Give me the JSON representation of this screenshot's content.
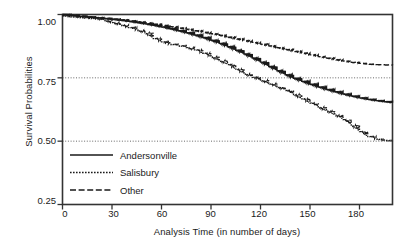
{
  "chart_data": {
    "type": "line",
    "title": "",
    "xlabel": "Analysis Time (in number of days)",
    "ylabel": "Survival Probabilities",
    "xlim": [
      0,
      200
    ],
    "ylim": [
      0.25,
      1.0
    ],
    "xticks": [
      0,
      30,
      60,
      90,
      120,
      150,
      180
    ],
    "yticks": [
      0.25,
      0.5,
      0.75,
      1.0
    ],
    "ytick_labels": [
      "0.25",
      "0.50",
      "0.75",
      "1.00"
    ],
    "xtick_labels": [
      "0",
      "30",
      "60",
      "90",
      "120",
      "150",
      "180"
    ],
    "grid": "horizontal-dotted-at-yticks",
    "legend_position": "lower-left-inside",
    "step_style": "kaplan-meier-step",
    "series": [
      {
        "name": "Andersonville",
        "style": "solid",
        "color": "#1a1a1a",
        "x": [
          0,
          5,
          10,
          15,
          20,
          25,
          30,
          35,
          40,
          45,
          50,
          55,
          60,
          65,
          70,
          75,
          80,
          85,
          90,
          95,
          100,
          105,
          110,
          115,
          120,
          125,
          130,
          135,
          140,
          145,
          150,
          155,
          160,
          165,
          170,
          175,
          180,
          185,
          190,
          195,
          200
        ],
        "y": [
          1.0,
          0.996,
          0.993,
          0.99,
          0.987,
          0.984,
          0.981,
          0.977,
          0.973,
          0.968,
          0.963,
          0.957,
          0.951,
          0.944,
          0.936,
          0.928,
          0.919,
          0.909,
          0.898,
          0.886,
          0.873,
          0.859,
          0.844,
          0.828,
          0.812,
          0.795,
          0.778,
          0.762,
          0.748,
          0.736,
          0.725,
          0.714,
          0.704,
          0.695,
          0.686,
          0.678,
          0.671,
          0.665,
          0.66,
          0.656,
          0.652
        ]
      },
      {
        "name": "Salisbury",
        "style": "dotted",
        "color": "#1a1a1a",
        "x": [
          0,
          5,
          10,
          15,
          20,
          25,
          30,
          35,
          40,
          45,
          50,
          55,
          60,
          65,
          70,
          75,
          80,
          85,
          90,
          95,
          100,
          105,
          110,
          115,
          120,
          125,
          130,
          135,
          140,
          145,
          150,
          155,
          160,
          165,
          170,
          175,
          180,
          185,
          190,
          195,
          200
        ],
        "y": [
          0.995,
          0.991,
          0.988,
          0.985,
          0.982,
          0.977,
          0.968,
          0.958,
          0.948,
          0.938,
          0.928,
          0.905,
          0.892,
          0.882,
          0.876,
          0.869,
          0.86,
          0.847,
          0.833,
          0.818,
          0.802,
          0.784,
          0.766,
          0.752,
          0.74,
          0.727,
          0.714,
          0.7,
          0.684,
          0.667,
          0.65,
          0.634,
          0.618,
          0.603,
          0.585,
          0.563,
          0.538,
          0.518,
          0.508,
          0.503,
          0.5
        ]
      },
      {
        "name": "Other",
        "style": "dashed",
        "color": "#1a1a1a",
        "x": [
          0,
          5,
          10,
          15,
          20,
          25,
          30,
          35,
          40,
          45,
          50,
          55,
          60,
          65,
          70,
          75,
          80,
          85,
          90,
          95,
          100,
          105,
          110,
          115,
          120,
          125,
          130,
          135,
          140,
          145,
          150,
          155,
          160,
          165,
          170,
          175,
          180,
          185,
          190,
          195,
          200
        ],
        "y": [
          1.0,
          0.997,
          0.994,
          0.991,
          0.988,
          0.985,
          0.982,
          0.979,
          0.975,
          0.971,
          0.967,
          0.962,
          0.957,
          0.952,
          0.947,
          0.942,
          0.936,
          0.93,
          0.924,
          0.918,
          0.911,
          0.904,
          0.897,
          0.89,
          0.883,
          0.876,
          0.869,
          0.862,
          0.855,
          0.848,
          0.841,
          0.834,
          0.828,
          0.822,
          0.816,
          0.811,
          0.807,
          0.804,
          0.802,
          0.801,
          0.8
        ]
      }
    ],
    "legend": [
      {
        "label": "Andersonville",
        "style": "solid"
      },
      {
        "label": "Salisbury",
        "style": "dotted"
      },
      {
        "label": "Other",
        "style": "dashed"
      }
    ]
  }
}
